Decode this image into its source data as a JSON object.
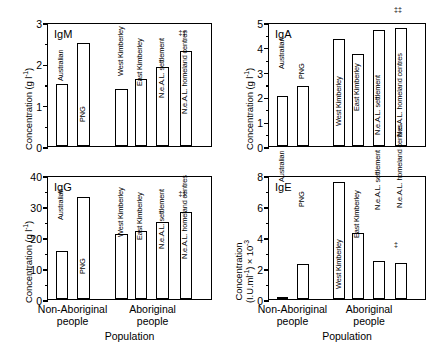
{
  "figure": {
    "x_axis_title": "Population",
    "groups": [
      {
        "line1": "Non-Aboriginal",
        "line2": "people"
      },
      {
        "line1": "Aboriginal",
        "line2": "people"
      }
    ],
    "dagger_symbol": "‡‡",
    "categories": [
      "Australian",
      "PNG",
      "West Kimberley",
      "East Kimberley",
      "N.e.A.L. settlement",
      "N.e.A.L. homeland centres"
    ]
  },
  "chart_data": [
    {
      "type": "bar",
      "title": "IgM",
      "panel_id": "igm",
      "xlabel": "Population",
      "ylabel": "Concentration (g l⁻¹)",
      "ylabel_line1": "Concentration (g l",
      "ylabel_sup": "-1",
      "ylabel_line2": ")",
      "ylim": [
        0,
        3
      ],
      "ymajor_step": 1,
      "yminor_step": 0.5,
      "ytick_labels": [
        "0",
        "1",
        "2",
        "3"
      ],
      "ytick_values": [
        0,
        1,
        2,
        3
      ],
      "grid": false,
      "legend": "none",
      "categories": [
        "Australian",
        "PNG",
        "West Kimberley",
        "East Kimberley",
        "N.e.A.L. settlement",
        "N.e.A.L. homeland centres"
      ],
      "values": [
        1.5,
        2.5,
        1.38,
        1.62,
        1.9,
        2.3
      ],
      "annotations": [
        {
          "category": "N.e.A.L. homeland centres",
          "symbol": "‡‡"
        }
      ]
    },
    {
      "type": "bar",
      "title": "IgA",
      "panel_id": "iga",
      "xlabel": "Population",
      "ylabel": "Concentration (g l⁻¹)",
      "ylabel_line1": "Concentration (g l",
      "ylabel_sup": "-1",
      "ylabel_line2": ")",
      "ylim": [
        0,
        5
      ],
      "ymajor_step": 1,
      "yminor_step": 0.5,
      "ytick_labels": [
        "0",
        "1",
        "2",
        "3",
        "4",
        "5"
      ],
      "ytick_values": [
        0,
        1,
        2,
        3,
        4,
        5
      ],
      "grid": false,
      "legend": "none",
      "categories": [
        "Australian",
        "PNG",
        "West Kimberley",
        "East Kimberley",
        "N.e.A.L. settlement",
        "N.e.A.L. homeland centres"
      ],
      "values": [
        2.0,
        2.4,
        4.33,
        3.7,
        4.67,
        4.77
      ],
      "annotations": [
        {
          "category": "N.e.A.L. homeland centres",
          "symbol": "‡‡"
        }
      ]
    },
    {
      "type": "bar",
      "title": "IgG",
      "panel_id": "igg",
      "xlabel": "Population",
      "ylabel": "Concentration (g l⁻¹)",
      "ylabel_line1": "Concentration (g l",
      "ylabel_sup": "-1",
      "ylabel_line2": ")",
      "ylim": [
        0,
        40
      ],
      "ymajor_step": 10,
      "yminor_step": 5,
      "ytick_labels": [
        "0",
        "10",
        "20",
        "30",
        "40"
      ],
      "ytick_values": [
        0,
        10,
        20,
        30,
        40
      ],
      "grid": false,
      "legend": "none",
      "categories": [
        "Australian",
        "PNG",
        "West Kimberley",
        "East Kimberley",
        "N.e.A.L. settlement",
        "N.e.A.L. homeland centres"
      ],
      "values": [
        15.6,
        32.8,
        21.0,
        22.0,
        24.7,
        28.2
      ],
      "annotations": [
        {
          "category": "N.e.A.L. homeland centres",
          "symbol": "‡‡"
        }
      ]
    },
    {
      "type": "bar",
      "title": "IgE",
      "panel_id": "ige",
      "xlabel": "Population",
      "ylabel": "Concentration (I.U.ml⁻¹) × 10⁻³",
      "ylabel_line1": "Concentration",
      "ylabel_line2": "(I.U.ml",
      "ylabel_sup": "-1",
      "ylabel_line3": ") × 10",
      "ylabel_sup2": "-3",
      "ylim": [
        0,
        8
      ],
      "ymajor_step": 2,
      "yminor_step": 1,
      "ytick_labels": [
        "0",
        "2",
        "4",
        "6",
        "8"
      ],
      "ytick_values": [
        0,
        2,
        4,
        6,
        8
      ],
      "grid": false,
      "legend": "none",
      "categories": [
        "Australian",
        "PNG",
        "West Kimberley",
        "East Kimberley",
        "N.e.A.L. settlement",
        "N.e.A.L. homeland centres"
      ],
      "values": [
        0.15,
        2.25,
        7.55,
        4.25,
        2.45,
        2.35
      ],
      "annotations": [
        {
          "category": "N.e.A.L. homeland centres",
          "symbol": "‡"
        }
      ]
    }
  ]
}
